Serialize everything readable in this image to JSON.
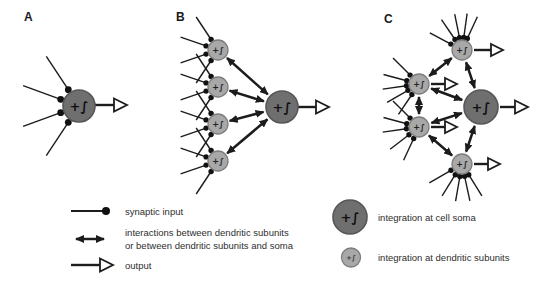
{
  "figure": {
    "panel_a_label": "A",
    "panel_b_label": "B",
    "panel_c_label": "C"
  },
  "node_labels": {
    "soma": "+∫",
    "subunit": "+∫"
  },
  "legend": {
    "synaptic_input": "synaptic input",
    "interactions_line1": "interactions between dendritic subunits",
    "interactions_line2": "or between dendritic subunits and soma",
    "output": "output",
    "integration_soma": "integration at cell soma",
    "integration_dendritic": "integration at dendritic subunits"
  },
  "colors": {
    "background": "#ffffff",
    "soma_fill": "#6f6f6f",
    "soma_stroke": "#565656",
    "subunit_fill": "#a8a8a8",
    "subunit_stroke": "#7d7d7d",
    "ink": "#1c1c1c"
  }
}
